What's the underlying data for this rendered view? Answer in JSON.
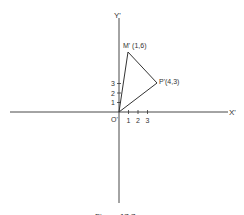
{
  "figure": {
    "caption": "Figure 17.7",
    "axes": {
      "x_label": "X'",
      "y_label": "Y'",
      "origin_label": "O'",
      "x_ticks": [
        "1",
        "2",
        "3"
      ],
      "y_ticks": [
        "1",
        "2",
        "3"
      ]
    },
    "points": {
      "M": {
        "label": "M' (1,6)",
        "x": 1,
        "y": 6
      },
      "P": {
        "label": "P'(4,3)",
        "x": 4,
        "y": 3
      },
      "O": {
        "label": "O'",
        "x": 0,
        "y": 0
      }
    },
    "shape": "triangle O'M'P'",
    "colors": {
      "line": "#333333",
      "background": "#ffffff"
    }
  }
}
